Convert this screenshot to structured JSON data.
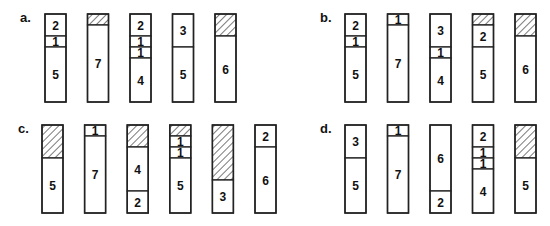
{
  "bin_capacity": 8,
  "panels": [
    {
      "label": "a.",
      "bins": [
        [
          {
            "size": 2,
            "label": "2"
          },
          {
            "size": 1,
            "label": "1"
          },
          {
            "size": 5,
            "label": "5"
          }
        ],
        [
          {
            "size": 1,
            "empty": true
          },
          {
            "size": 7,
            "label": "7"
          }
        ],
        [
          {
            "size": 2,
            "label": "2"
          },
          {
            "size": 1,
            "label": "1"
          },
          {
            "size": 1,
            "label": "1"
          },
          {
            "size": 4,
            "label": "4"
          }
        ],
        [
          {
            "size": 3,
            "label": "3"
          },
          {
            "size": 5,
            "label": "5"
          }
        ],
        [
          {
            "size": 2,
            "empty": true
          },
          {
            "size": 6,
            "label": "6"
          }
        ]
      ]
    },
    {
      "label": "b.",
      "bins": [
        [
          {
            "size": 2,
            "label": "2"
          },
          {
            "size": 1,
            "label": "1"
          },
          {
            "size": 5,
            "label": "5"
          }
        ],
        [
          {
            "size": 1,
            "label": "1"
          },
          {
            "size": 7,
            "label": "7"
          }
        ],
        [
          {
            "size": 3,
            "label": "3"
          },
          {
            "size": 1,
            "label": "1"
          },
          {
            "size": 4,
            "label": "4"
          }
        ],
        [
          {
            "size": 1,
            "empty": true
          },
          {
            "size": 2,
            "label": "2"
          },
          {
            "size": 5,
            "label": "5"
          }
        ],
        [
          {
            "size": 2,
            "empty": true
          },
          {
            "size": 6,
            "label": "6"
          }
        ]
      ]
    },
    {
      "label": "c.",
      "bins": [
        [
          {
            "size": 3,
            "empty": true
          },
          {
            "size": 5,
            "label": "5"
          }
        ],
        [
          {
            "size": 1,
            "label": "1"
          },
          {
            "size": 7,
            "label": "7"
          }
        ],
        [
          {
            "size": 2,
            "empty": true
          },
          {
            "size": 4,
            "label": "4"
          },
          {
            "size": 2,
            "label": "2"
          }
        ],
        [
          {
            "size": 1,
            "empty": true
          },
          {
            "size": 1,
            "label": "1"
          },
          {
            "size": 1,
            "label": "1"
          },
          {
            "size": 5,
            "label": "5"
          }
        ],
        [
          {
            "size": 5,
            "empty": true
          },
          {
            "size": 3,
            "label": "3"
          }
        ],
        [
          {
            "size": 2,
            "label": "2"
          },
          {
            "size": 6,
            "label": "6"
          }
        ]
      ]
    },
    {
      "label": "d.",
      "bins": [
        [
          {
            "size": 3,
            "label": "3"
          },
          {
            "size": 5,
            "label": "5"
          }
        ],
        [
          {
            "size": 1,
            "label": "1"
          },
          {
            "size": 7,
            "label": "7"
          }
        ],
        [
          {
            "size": 6,
            "label": "6"
          },
          {
            "size": 2,
            "label": "2"
          }
        ],
        [
          {
            "size": 2,
            "label": "2"
          },
          {
            "size": 1,
            "label": "1"
          },
          {
            "size": 1,
            "label": "1"
          },
          {
            "size": 4,
            "label": "4"
          }
        ],
        [
          {
            "size": 3,
            "empty": true
          },
          {
            "size": 5,
            "label": "5"
          }
        ]
      ]
    }
  ]
}
